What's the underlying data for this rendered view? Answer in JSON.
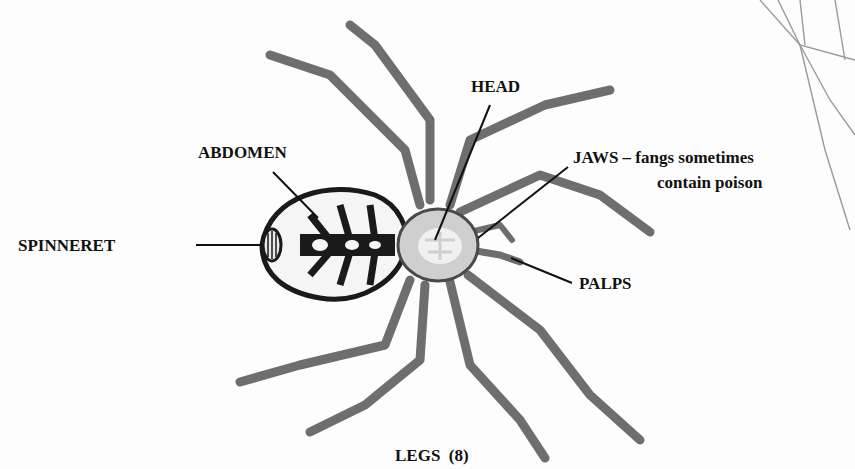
{
  "diagram": {
    "labels": {
      "head": "HEAD",
      "abdomen": "ABDOMEN",
      "spinneret": "SPINNERET",
      "jaws_line1": "JAWS – fangs sometimes",
      "jaws_line2": "contain poison",
      "palps": "PALPS",
      "legs": "LEGS  (8)"
    },
    "colors": {
      "text": "#111111",
      "ink": "#1a1a1a",
      "leg": "#6e6e6e",
      "head_fill": "#cfcfcf",
      "abdomen_fill": "#f5f5f5",
      "web": "#9a9a9a"
    }
  }
}
